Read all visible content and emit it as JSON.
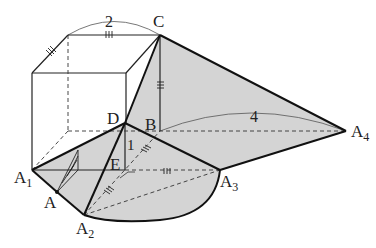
{
  "figure": {
    "type": "geometry-diagram"
  },
  "labels": {
    "C": "C",
    "D": "D",
    "B": "B",
    "E": "E",
    "A": "A",
    "A1": "A",
    "A1_sub": "1",
    "A2": "A",
    "A2_sub": "2",
    "A3": "A",
    "A3_sub": "3",
    "A4": "A",
    "A4_sub": "4"
  },
  "measurements": {
    "top_edge": "2",
    "long_edge": "4",
    "height_DE": "1"
  },
  "colors": {
    "fill": "#d4d4d4",
    "stroke": "#111111",
    "thin": "#333333"
  }
}
